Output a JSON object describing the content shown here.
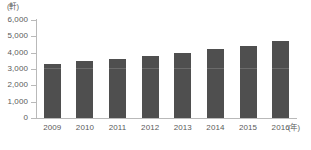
{
  "chart_data": {
    "type": "bar",
    "title": "",
    "subtitle": "",
    "xlabel": "年",
    "ylabel": "軒",
    "y_unit_label": "(軒)",
    "x_unit_label": "(年)",
    "categories": [
      "2009",
      "2010",
      "2011",
      "2012",
      "2013",
      "2014",
      "2015",
      "2016"
    ],
    "values": [
      3300,
      3500,
      3600,
      3800,
      4000,
      4250,
      4400,
      4700
    ],
    "ylim": [
      0,
      6000
    ],
    "y_ticks": [
      6000,
      5000,
      4000,
      3000,
      2000,
      1000,
      0
    ],
    "y_tick_labels": [
      "6,000",
      "5,000",
      "4,000",
      "3,000",
      "2,000",
      "1,000",
      "0"
    ],
    "grid": false,
    "legend": false,
    "legend_position": "none",
    "bar_color": "#4f4f4f",
    "axis_color": "#b9b9b9",
    "text_color": "#5a5a5a",
    "background_color": "#ffffff"
  }
}
